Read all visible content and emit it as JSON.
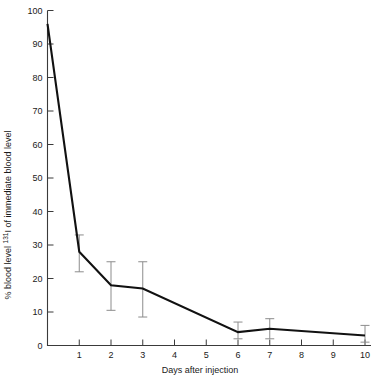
{
  "chart_data": {
    "type": "line",
    "title": "",
    "xlabel": "Days after injection",
    "ylabel": "% blood level 131I of immediate blood level",
    "ylabel_parts": {
      "prefix": "% blood level ",
      "superscript": "131",
      "isotope": "I",
      "suffix": " of immediate blood level"
    },
    "x": [
      0,
      1,
      2,
      3,
      6,
      7,
      10
    ],
    "values": [
      96,
      28,
      18,
      17,
      4,
      5,
      3
    ],
    "error_low": [
      null,
      22,
      10.5,
      8.5,
      2,
      2,
      1
    ],
    "error_high": [
      null,
      33,
      25,
      25,
      7,
      8,
      6
    ],
    "xlim": [
      0,
      10
    ],
    "ylim": [
      0,
      100
    ],
    "xticks": [
      0,
      1,
      2,
      3,
      4,
      5,
      6,
      7,
      8,
      9,
      10
    ],
    "xtick_labels": [
      "",
      "1",
      "2",
      "3",
      "4",
      "5",
      "6",
      "7",
      "8",
      "9",
      "10"
    ],
    "yticks": [
      0,
      10,
      20,
      30,
      40,
      50,
      60,
      70,
      80,
      90,
      100
    ],
    "ytick_labels": [
      "0",
      "10",
      "20",
      "30",
      "40",
      "50",
      "60",
      "70",
      "80",
      "90",
      "100"
    ],
    "origin_label": "0",
    "grid": false,
    "legend": null,
    "line_color": "#111111",
    "error_color": "#8c8c8c",
    "axis_color": "#3a3a3a",
    "background": "#ffffff"
  }
}
